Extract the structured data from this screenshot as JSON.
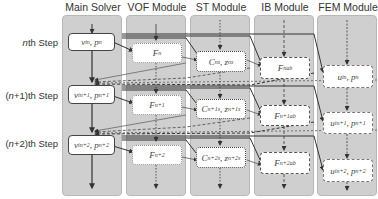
{
  "columns": [
    {
      "title": "Main Solver"
    },
    {
      "title": "VOF Module"
    },
    {
      "title": "ST Module"
    },
    {
      "title": "IB Module"
    },
    {
      "title": "FEM Module"
    }
  ],
  "rows": [
    {
      "prefix": "",
      "n": "n",
      "suffix": "th Step"
    },
    {
      "prefix": "(",
      "n": "n",
      "suffix": "+1)th Step"
    },
    {
      "prefix": "(",
      "n": "n",
      "suffix": "+2)th Step"
    }
  ],
  "nodes": {
    "main": [
      {
        "base": "v",
        "sub": "i",
        "sup": "n",
        "base2": "p",
        "sup2": "n"
      },
      {
        "base": "v",
        "sub": "i",
        "sup": "n+1",
        "base2": "p",
        "sup2": "n+1"
      },
      {
        "base": "v",
        "sub": "i",
        "sup": "n+2",
        "base2": "p",
        "sup2": "n+2"
      }
    ],
    "vof": [
      {
        "base": "F",
        "sup": "n"
      },
      {
        "base": "F",
        "sup": "n+1"
      },
      {
        "base": "F",
        "sup": "n+2"
      }
    ],
    "st": [
      {
        "base": "C",
        "sup": "n",
        "sub": "s",
        "base2": "z",
        "sup2": "n",
        "sub2": "s"
      },
      {
        "base": "C",
        "sup": "n+1",
        "sub": "s",
        "base2": "z",
        "sup2": "n+1",
        "sub2": "s"
      },
      {
        "base": "C",
        "sup": "n+2",
        "sub": "s",
        "base2": "z",
        "sup2": "n+2",
        "sub2": "s"
      }
    ],
    "ib": [
      {
        "base": "F",
        "sup": "n",
        "sub": "ab"
      },
      {
        "base": "F",
        "sup": "n+1",
        "sub": "ab"
      },
      {
        "base": "F",
        "sup": "n+2",
        "sub": "ab"
      }
    ],
    "fem": [
      {
        "base": "u",
        "sub": "i",
        "sup": "n",
        "base2": "p",
        "sup2": "n"
      },
      {
        "base": "u",
        "sub": "i",
        "sup": "n+1",
        "base2": "p",
        "sup2": "n+1"
      },
      {
        "base": "u",
        "sub": "i",
        "sup": "n+2",
        "base2": "p",
        "sup2": "n+2"
      }
    ]
  },
  "colors": {
    "panel": "#cfcfcf",
    "node_bg": "#ffffff",
    "line": "#333333"
  }
}
